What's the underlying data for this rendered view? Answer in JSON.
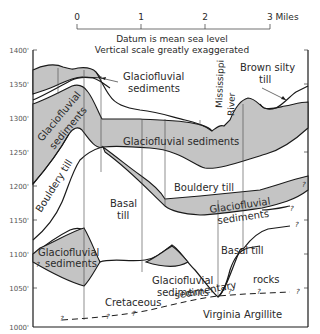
{
  "scale_bar": {
    "ticks": [
      "0",
      "1",
      "2",
      "3 Miles"
    ]
  },
  "notes": {
    "datum": "Datum is mean sea level",
    "vertical": "Vertical scale greatly exaggerated"
  },
  "y_axis": {
    "ticks": [
      "1400'",
      "1350'",
      "1300'",
      "1250'",
      "1200'",
      "1150'",
      "1100'",
      "1050'",
      "1000'"
    ]
  },
  "units": {
    "glaciofluvial_top_label_1": "Glaciofluvial",
    "glaciofluvial_top_label_2": "sediments",
    "glaciofluvial_left_1": "Glaciofluvial",
    "glaciofluvial_left_2": "sediments",
    "glaciofluvial_main": "Glaciofluvial sediments",
    "mississippi_1": "Mississippi",
    "mississippi_2": "River",
    "brown_silty_1": "Brown silty",
    "brown_silty_2": "till",
    "bouldery_till_left": "Bouldery till",
    "bouldery_till_mid": "Bouldery till",
    "basal_till_left_1": "Basal",
    "basal_till_left_2": "till",
    "glaciofluvial_right_1": "Glaciofluvial",
    "glaciofluvial_right_2": "sediments",
    "glaciofluvial_lower_left_1": "Glaciofluvial",
    "glaciofluvial_lower_left_2": "sediments",
    "basal_till_right": "Basal till",
    "glaciofluvial_lower_mid_1": "Glaciofluvial",
    "glaciofluvial_lower_mid_2": "sediments",
    "rocks": "rocks",
    "cretaceous": "Cretaceous",
    "sedimentary": "sedimentary",
    "virginia_argillite": "Virginia Argillite",
    "uncertain_mark": "?"
  }
}
